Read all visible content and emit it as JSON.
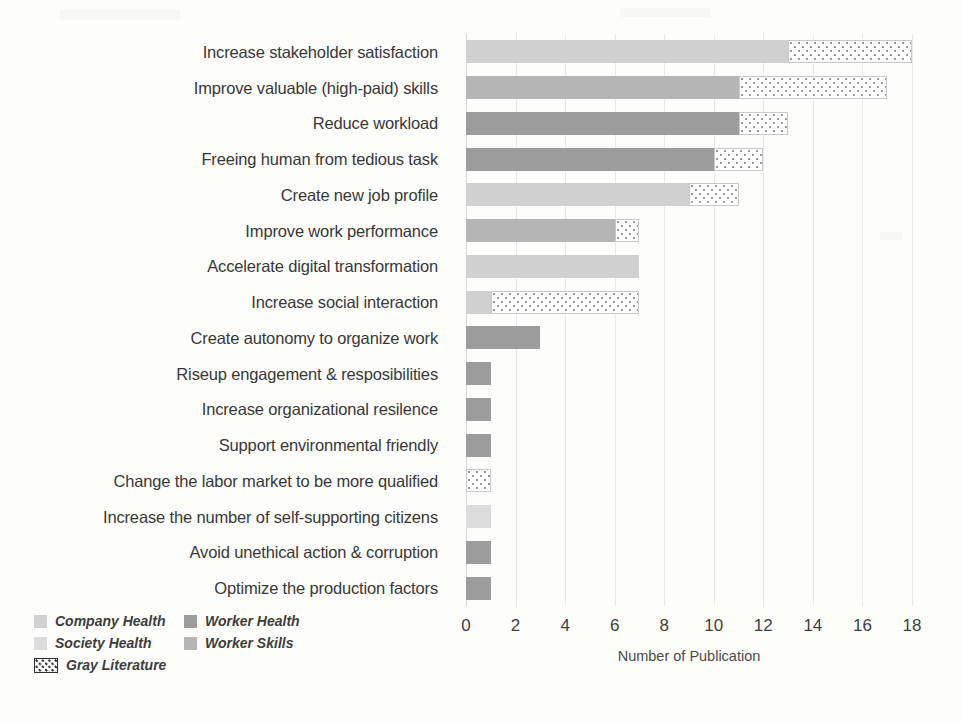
{
  "chart_data": {
    "type": "bar",
    "orientation": "horizontal",
    "stacked": true,
    "title": "",
    "xlabel": "Number of Publication",
    "ylabel": "",
    "xlim": [
      0,
      18
    ],
    "xticks": [
      "0",
      "2",
      "4",
      "6",
      "8",
      "10",
      "12",
      "14",
      "16",
      "18"
    ],
    "xtick_values": [
      0,
      2,
      4,
      6,
      8,
      10,
      12,
      14,
      16,
      18
    ],
    "grid": true,
    "legend_position": "bottom-left",
    "categories": [
      "Increase stakeholder satisfaction",
      "Improve valuable (high-paid) skills",
      "Reduce workload",
      "Freeing human from tedious task",
      "Create new job profile",
      "Improve work performance",
      "Accelerate digital transformation",
      "Increase social interaction",
      "Create autonomy to organize work",
      "Riseup engagement & resposibilities",
      "Increase organizational resilence",
      "Support environmental friendly",
      "Change the labor market to be more qualified",
      "Increase the number of self-supporting citizens",
      "Avoid unethical action & corruption",
      "Optimize the production factors"
    ],
    "series": [
      {
        "name": "Company Health",
        "color": "#d0d0d0",
        "values": [
          13,
          0,
          0,
          0,
          9,
          0,
          7,
          1,
          0,
          0,
          0,
          0,
          0,
          0,
          0,
          0
        ]
      },
      {
        "name": "Society Health",
        "color": "#dcdcdc",
        "values": [
          0,
          0,
          0,
          0,
          0,
          0,
          0,
          0,
          0,
          0,
          0,
          0,
          0,
          1,
          0,
          0
        ]
      },
      {
        "name": "Worker Health",
        "color": "#9c9c9c",
        "values": [
          0,
          0,
          11,
          10,
          0,
          0,
          0,
          0,
          3,
          1,
          1,
          1,
          0,
          0,
          1,
          1
        ]
      },
      {
        "name": "Worker Skills",
        "color": "#b5b5b5",
        "values": [
          0,
          11,
          0,
          0,
          0,
          6,
          0,
          0,
          0,
          0,
          0,
          0,
          0,
          0,
          0,
          0
        ]
      },
      {
        "name": "Gray Literature",
        "color": "#ffffff",
        "pattern": "dotted",
        "values": [
          5,
          6,
          2,
          2,
          2,
          1,
          0,
          6,
          0,
          0,
          0,
          0,
          1,
          0,
          0,
          0
        ]
      }
    ],
    "totals": [
      18,
      17,
      13,
      12,
      11,
      7,
      7,
      7,
      3,
      1,
      1,
      1,
      1,
      1,
      1,
      1
    ]
  },
  "legend": {
    "entries": [
      {
        "label": "Company Health",
        "color": "#d0d0d0",
        "pattern": "solid"
      },
      {
        "label": "Worker Health",
        "color": "#9c9c9c",
        "pattern": "solid"
      },
      {
        "label": "Society Health",
        "color": "#dcdcdc",
        "pattern": "solid"
      },
      {
        "label": "Worker Skills",
        "color": "#b5b5b5",
        "pattern": "solid"
      },
      {
        "label": "Gray Literature",
        "color": "#ffffff",
        "pattern": "dotted"
      }
    ]
  },
  "colors": {
    "company_health": "#d0d0d0",
    "society_health": "#dcdcdc",
    "worker_health": "#9c9c9c",
    "worker_skills": "#b5b5b5",
    "gray_literature": "#ffffff",
    "gridline": "#e9e9e9",
    "text": "#383838",
    "background": "#fdfdfc"
  }
}
